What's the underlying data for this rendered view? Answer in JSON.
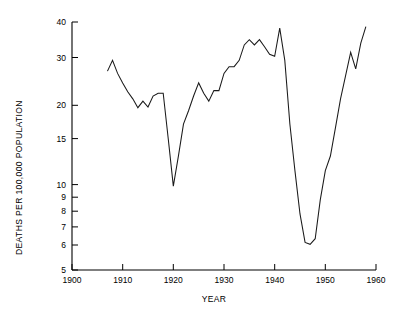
{
  "chart_data": {
    "type": "line",
    "title": "",
    "xlabel": "YEAR",
    "ylabel": "DEATHS PER 100,000 POPULATION",
    "yscale": "log",
    "xlim": [
      1900,
      1960
    ],
    "ylim": [
      5,
      40
    ],
    "grid": false,
    "legend": null,
    "xticks": [
      1900,
      1910,
      1920,
      1930,
      1940,
      1950,
      1960
    ],
    "xtick_labels": [
      "1900",
      "1910",
      "1920",
      "1930",
      "1940",
      "1950",
      "1960"
    ],
    "yticks": [
      5,
      6,
      7,
      8,
      9,
      10,
      15,
      20,
      30,
      40
    ],
    "ytick_labels": [
      "5",
      "6",
      "7",
      "8",
      "9",
      "10",
      "15",
      "20",
      "30",
      "40"
    ],
    "series": [
      {
        "name": "deaths-per-100000",
        "x": [
          1907,
          1908,
          1909,
          1910,
          1911,
          1912,
          1913,
          1914,
          1915,
          1916,
          1917,
          1918,
          1919,
          1920,
          1921,
          1922,
          1923,
          1924,
          1925,
          1926,
          1927,
          1928,
          1929,
          1930,
          1931,
          1932,
          1933,
          1934,
          1935,
          1936,
          1937,
          1938,
          1939,
          1940,
          1941,
          1942,
          1943,
          1944,
          1945,
          1946,
          1947,
          1948,
          1949,
          1950,
          1951,
          1952,
          1953,
          1954,
          1955,
          1956,
          1957,
          1958
        ],
        "values": [
          26.5,
          29.0,
          26.0,
          24.0,
          22.3,
          21.0,
          19.5,
          20.6,
          19.6,
          21.5,
          22.0,
          22.0,
          15.0,
          10.1,
          13.0,
          17.0,
          19.0,
          21.5,
          24.0,
          22.0,
          20.6,
          22.5,
          22.5,
          26.0,
          27.5,
          27.5,
          29.0,
          33.0,
          34.5,
          33.0,
          34.5,
          32.5,
          30.5,
          30.0,
          38.0,
          29.0,
          17.0,
          11.5,
          8.0,
          6.3,
          6.2,
          6.5,
          9.0,
          11.5,
          13.0,
          16.5,
          21.0,
          25.5,
          31.0,
          27.0,
          33.5,
          38.5
        ]
      }
    ]
  }
}
